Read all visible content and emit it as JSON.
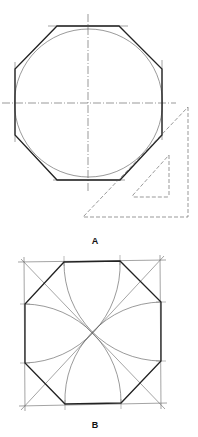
{
  "figures": [
    {
      "id": "A",
      "label": "A",
      "label_pos": [
        95,
        241
      ],
      "description": "Octagon circumscribed about a circle, constructed with a 45-degree triangle",
      "circle": {
        "cx": 88.5,
        "cy": 103,
        "r": 74
      },
      "octagon_vertices": [
        [
          57,
          26
        ],
        [
          119,
          26
        ],
        [
          162,
          69
        ],
        [
          162,
          135
        ],
        [
          120,
          180
        ],
        [
          57,
          180
        ],
        [
          15,
          135
        ],
        [
          15,
          69
        ]
      ],
      "centerlines": {
        "vertical": [
          88,
          14,
          88,
          193
        ],
        "horizontal": [
          2,
          103,
          176,
          103
        ]
      },
      "triangle_outer": [
        [
          188,
          107
        ],
        [
          188,
          217
        ],
        [
          83,
          217
        ]
      ],
      "triangle_inner": [
        [
          169,
          155
        ],
        [
          169,
          197
        ],
        [
          132,
          197
        ]
      ]
    },
    {
      "id": "B",
      "label": "B",
      "label_pos": [
        95,
        425
      ],
      "description": "Octagon inscribed in a square using arcs from the corners",
      "square": [
        [
          24,
          262
        ],
        [
          160,
          260
        ],
        [
          161,
          404
        ],
        [
          25,
          406
        ]
      ],
      "center": [
        92,
        333
      ],
      "octagon_vertices": [
        [
          64,
          262
        ],
        [
          120,
          261
        ],
        [
          161,
          302
        ],
        [
          161,
          361
        ],
        [
          121,
          403
        ],
        [
          65,
          404
        ],
        [
          25,
          363
        ],
        [
          25,
          304
        ]
      ]
    }
  ],
  "colors": {
    "line": "#222222",
    "thin": "#555555",
    "background": "#ffffff"
  }
}
